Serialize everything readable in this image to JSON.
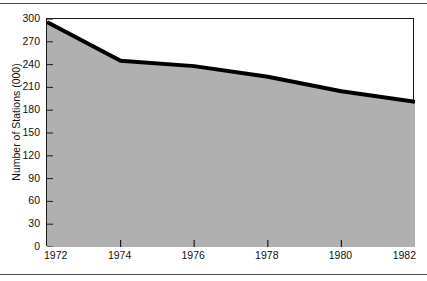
{
  "figure": {
    "name": "number-of-stations-line-area-chart",
    "fill_color": "#b0b0b0",
    "line_color": "#000000",
    "frame_color": "#1a1a1a"
  },
  "chart_data": {
    "type": "area",
    "title": "",
    "subtitle": "",
    "xlabel": "",
    "ylabel": "Number of Stations (000)",
    "x": [
      1972,
      1974,
      1976,
      1978,
      1980,
      1982
    ],
    "values": [
      296,
      245,
      238,
      224,
      205,
      191
    ],
    "series": [
      {
        "name": "Number of Stations (000)",
        "values": [
          296,
          245,
          238,
          224,
          205,
          191
        ]
      }
    ],
    "xlim": [
      1972,
      1982
    ],
    "ylim": [
      0,
      300
    ],
    "x_tick_labels": [
      "1972",
      "1974",
      "1976",
      "1978",
      "1980",
      "1982"
    ],
    "y_tick_labels": [
      "0",
      "30",
      "60",
      "90",
      "120",
      "150",
      "180",
      "210",
      "240",
      "270",
      "300"
    ],
    "y_ticks": [
      0,
      30,
      60,
      90,
      120,
      150,
      180,
      210,
      240,
      270,
      300
    ],
    "grid": false,
    "legend": false,
    "legend_position": "none",
    "annotations": []
  }
}
